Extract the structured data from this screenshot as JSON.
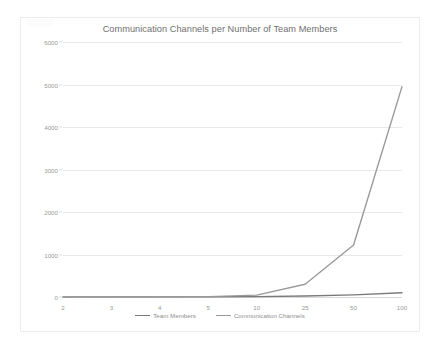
{
  "chart_data": {
    "type": "line",
    "title": "Communication Channels per Number of Team Members",
    "xlabel": "",
    "ylabel": "",
    "categories": [
      "2",
      "3",
      "4",
      "5",
      "10",
      "25",
      "50",
      "100"
    ],
    "ylim": [
      0,
      6000
    ],
    "yticks": [
      "0",
      "1000",
      "2000",
      "3000",
      "4000",
      "5000",
      "6000"
    ],
    "ytick_values": [
      0,
      1000,
      2000,
      3000,
      4000,
      5000,
      6000
    ],
    "grid": true,
    "legend_position": "bottom",
    "series": [
      {
        "name": "Team Members",
        "color": "#7a7a7a",
        "values": [
          2,
          3,
          4,
          5,
          10,
          25,
          50,
          100
        ]
      },
      {
        "name": "Communication Channels",
        "color": "#9a9a9a",
        "values": [
          1,
          3,
          6,
          10,
          45,
          300,
          1225,
          4950
        ]
      }
    ]
  },
  "colors": {
    "background": "#ffffff",
    "gridline": "#e9e9e9",
    "axis": "#d9d9d9",
    "title_text": "#6f6f6f",
    "tick_text": "#9a9a9a",
    "legend_text": "#8e8e8e"
  }
}
